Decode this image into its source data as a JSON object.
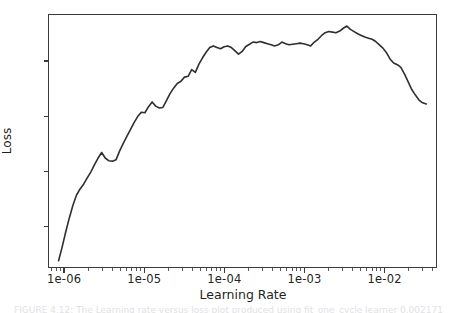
{
  "figure": {
    "background_color": "#ffffff",
    "line_color": "#2f2f2f",
    "axis_color": "#3b3b3b",
    "caption_text": "FIGURE 4.12: The Learning rate versus loss plot produced using fit_one_cycle learner 0.002171"
  },
  "chart_data": {
    "type": "line",
    "title": "",
    "xlabel": "Learning Rate",
    "ylabel": "Loss",
    "xscale": "log",
    "yscale": "linear",
    "grid": false,
    "legend": null,
    "xlim": [
      6.3e-07,
      0.045
    ],
    "ylim": [
      60.5,
      69.7
    ],
    "xtick_labels": [
      "1e-06",
      "1e-05",
      "1e-04",
      "1e-03",
      "1e-02"
    ],
    "xtick_values": [
      1e-06,
      1e-05,
      0.0001,
      0.001,
      0.01
    ],
    "ytick_labels": [
      "62",
      "64",
      "66",
      "68"
    ],
    "ytick_values": [
      62,
      64,
      66,
      68
    ],
    "series": [
      {
        "name": "loss",
        "x": [
          8.3e-07,
          9.2e-07,
          1.02e-06,
          1.13e-06,
          1.25e-06,
          1.39e-06,
          1.54e-06,
          1.71e-06,
          1.89e-06,
          2.1e-06,
          2.33e-06,
          2.58e-06,
          2.86e-06,
          3.17e-06,
          3.52e-06,
          3.9e-06,
          4.33e-06,
          4.8e-06,
          5.32e-06,
          5.9e-06,
          6.54e-06,
          7.26e-06,
          8.05e-06,
          8.93e-06,
          9.9e-06,
          1.1e-05,
          1.22e-05,
          1.35e-05,
          1.5e-05,
          1.66e-05,
          1.84e-05,
          2.04e-05,
          2.26e-05,
          2.51e-05,
          2.79e-05,
          3.09e-05,
          3.43e-05,
          3.8e-05,
          4.22e-05,
          4.68e-05,
          5.19e-05,
          5.75e-05,
          6.38e-05,
          7.08e-05,
          7.85e-05,
          8.71e-05,
          9.66e-05,
          0.000107,
          0.000119,
          0.000132,
          0.000146,
          0.000162,
          0.00018,
          0.0002,
          0.000221,
          0.000246,
          0.000272,
          0.000302,
          0.000335,
          0.000372,
          0.000412,
          0.000457,
          0.000507,
          0.000563,
          0.000624,
          0.000692,
          0.000768,
          0.000852,
          0.000945,
          0.00105,
          0.00116,
          0.00129,
          0.00143,
          0.00159,
          0.00176,
          0.00195,
          0.00217,
          0.0024,
          0.00267,
          0.00296,
          0.00328,
          0.00364,
          0.00404,
          0.00448,
          0.00497,
          0.00551,
          0.00611,
          0.00678,
          0.00752,
          0.00834,
          0.00925,
          0.0103,
          0.0114,
          0.0126,
          0.014,
          0.0155,
          0.0172,
          0.0191,
          0.0212,
          0.0235,
          0.0261,
          0.0289,
          0.0321
        ],
        "y": [
          60.8,
          61.3,
          61.85,
          62.35,
          62.8,
          63.18,
          63.4,
          63.58,
          63.8,
          64.02,
          64.28,
          64.52,
          64.72,
          64.52,
          64.42,
          64.4,
          64.46,
          64.78,
          65.05,
          65.3,
          65.55,
          65.8,
          66.02,
          66.18,
          66.16,
          66.38,
          66.55,
          66.4,
          66.33,
          66.35,
          66.6,
          66.85,
          67.05,
          67.22,
          67.3,
          67.45,
          67.48,
          67.72,
          67.62,
          67.92,
          68.15,
          68.35,
          68.52,
          68.58,
          68.52,
          68.48,
          68.55,
          68.58,
          68.52,
          68.4,
          68.28,
          68.38,
          68.56,
          68.64,
          68.72,
          68.7,
          68.74,
          68.7,
          68.66,
          68.62,
          68.58,
          68.62,
          68.72,
          68.66,
          68.62,
          68.64,
          68.66,
          68.68,
          68.66,
          68.62,
          68.58,
          68.72,
          68.82,
          68.96,
          69.06,
          69.1,
          69.08,
          69.06,
          69.12,
          69.22,
          69.3,
          69.18,
          69.1,
          69.02,
          68.96,
          68.9,
          68.86,
          68.82,
          68.74,
          68.62,
          68.5,
          68.32,
          68.1,
          67.96,
          67.9,
          67.8,
          67.56,
          67.28,
          67.0,
          66.8,
          66.62,
          66.52,
          66.48
        ]
      }
    ],
    "annotations": {
      "peak_loss": 69.3,
      "peak_learning_rate": 0.00404,
      "start_loss": 60.8,
      "end_loss": 66.5
    }
  },
  "axes": {
    "y_title": "Loss",
    "x_title": "Learning Rate"
  }
}
